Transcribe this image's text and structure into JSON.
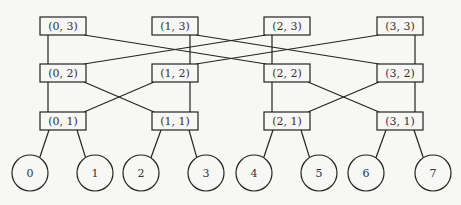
{
  "diagram": {
    "type": "butterfly-network",
    "switch_nodes": [
      {
        "id": "0-3",
        "label": "(0, 3)",
        "x": 40,
        "y": 17
      },
      {
        "id": "1-3",
        "label": "(1, 3)",
        "x": 152,
        "y": 17
      },
      {
        "id": "2-3",
        "label": "(2, 3)",
        "x": 264,
        "y": 17
      },
      {
        "id": "3-3",
        "label": "(3, 3)",
        "x": 377,
        "y": 17
      },
      {
        "id": "0-2",
        "label": "(0, 2)",
        "x": 40,
        "y": 64
      },
      {
        "id": "1-2",
        "label": "(1, 2)",
        "x": 152,
        "y": 64
      },
      {
        "id": "2-2",
        "label": "(2, 2)",
        "x": 264,
        "y": 64
      },
      {
        "id": "3-2",
        "label": "(3, 2)",
        "x": 377,
        "y": 64
      },
      {
        "id": "0-1",
        "label": "(0, 1)",
        "x": 40,
        "y": 112
      },
      {
        "id": "1-1",
        "label": "(1, 1)",
        "x": 152,
        "y": 112
      },
      {
        "id": "2-1",
        "label": "(2, 1)",
        "x": 264,
        "y": 112
      },
      {
        "id": "3-1",
        "label": "(3, 1)",
        "x": 377,
        "y": 112
      }
    ],
    "box_width": 46,
    "box_height": 18,
    "leaf_nodes": [
      {
        "id": "0",
        "label": "0",
        "cx": 30,
        "cy": 173
      },
      {
        "id": "1",
        "label": "1",
        "cx": 95,
        "cy": 173
      },
      {
        "id": "2",
        "label": "2",
        "cx": 141,
        "cy": 173
      },
      {
        "id": "3",
        "label": "3",
        "cx": 206,
        "cy": 173
      },
      {
        "id": "4",
        "label": "4",
        "cx": 254,
        "cy": 173
      },
      {
        "id": "5",
        "label": "5",
        "cx": 319,
        "cy": 173
      },
      {
        "id": "6",
        "label": "6",
        "cx": 366,
        "cy": 173
      },
      {
        "id": "7",
        "label": "7",
        "cx": 433,
        "cy": 173
      }
    ],
    "leaf_radius": 18,
    "edges": [
      [
        "0-3",
        "0-2"
      ],
      [
        "1-3",
        "1-2"
      ],
      [
        "2-3",
        "2-2"
      ],
      [
        "3-3",
        "3-2"
      ],
      [
        "0-3",
        "2-2"
      ],
      [
        "1-3",
        "3-2"
      ],
      [
        "2-3",
        "0-2"
      ],
      [
        "3-3",
        "1-2"
      ],
      [
        "0-2",
        "0-1"
      ],
      [
        "1-2",
        "1-1"
      ],
      [
        "2-2",
        "2-1"
      ],
      [
        "3-2",
        "3-1"
      ],
      [
        "0-2",
        "1-1"
      ],
      [
        "1-2",
        "0-1"
      ],
      [
        "2-2",
        "3-1"
      ],
      [
        "3-2",
        "2-1"
      ],
      [
        "0-1",
        "0"
      ],
      [
        "0-1",
        "1"
      ],
      [
        "1-1",
        "2"
      ],
      [
        "1-1",
        "3"
      ],
      [
        "2-1",
        "4"
      ],
      [
        "2-1",
        "5"
      ],
      [
        "3-1",
        "6"
      ],
      [
        "3-1",
        "7"
      ]
    ],
    "colors": {
      "stroke": "#222222",
      "background": "#f7f7f5",
      "text": "#333333"
    }
  }
}
